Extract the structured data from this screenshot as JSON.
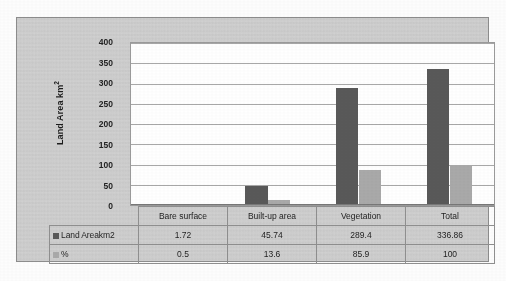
{
  "chart_data": {
    "type": "bar",
    "title": "",
    "xlabel": "",
    "ylabel": "Land Area km2",
    "ylabel_base": "Land Area km",
    "ylabel_sup": "2",
    "categories": [
      "Bare surface",
      "Built-up area",
      "Vegetation",
      "Total"
    ],
    "series": [
      {
        "name": "Land Areakm2",
        "color": "#595959",
        "values": [
          1.72,
          45.74,
          289.4,
          336.86
        ]
      },
      {
        "name": "%",
        "color": "#a9a9a9",
        "values": [
          0.5,
          13.6,
          85.9,
          100
        ]
      }
    ],
    "ylim": [
      0,
      400
    ],
    "yticks": [
      400,
      350,
      300,
      250,
      200,
      150,
      100,
      50,
      0
    ],
    "ytick_labels": [
      "400",
      "350",
      "300",
      "250",
      "200",
      "150",
      "100",
      "50",
      "0"
    ],
    "grid": true,
    "legend_position": "data-table",
    "has_data_table": true,
    "annotations": []
  },
  "data_table": {
    "category_header_row": [
      "Bare surface",
      "Built-up area",
      "Vegetation",
      "Total"
    ],
    "rows": [
      {
        "label": "Land Areakm2",
        "swatch": "swatch-primary",
        "values": [
          "1.72",
          "45.74",
          "289.4",
          "336.86"
        ]
      },
      {
        "label": "%",
        "swatch": "swatch-secondary",
        "values": [
          "0.5",
          "13.6",
          "85.9",
          "100"
        ]
      }
    ]
  },
  "colors": {
    "series_primary": "#595959",
    "series_secondary": "#a9a9a9",
    "chart_background": "#d3d3d3",
    "plot_background": "#ffffff",
    "gridline": "#a8a8a8",
    "border": "#8f8f8f"
  }
}
